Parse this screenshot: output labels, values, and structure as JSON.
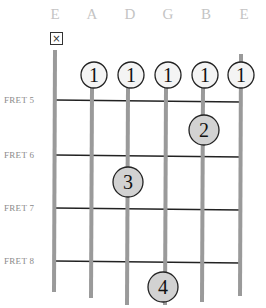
{
  "diagram": {
    "strings": [
      {
        "name": "E",
        "x": 55,
        "top": 50,
        "bottom": 292
      },
      {
        "name": "A",
        "x": 92,
        "top": 88,
        "bottom": 298
      },
      {
        "name": "D",
        "x": 128,
        "top": 88,
        "bottom": 305
      },
      {
        "name": "G",
        "x": 166,
        "top": 88,
        "bottom": 305
      },
      {
        "name": "B",
        "x": 203,
        "top": 88,
        "bottom": 302
      },
      {
        "name": "E",
        "x": 241,
        "top": 54,
        "bottom": 296
      }
    ],
    "frets": [
      {
        "label": "FRET 5",
        "y": 100
      },
      {
        "label": "FRET 6",
        "y": 155
      },
      {
        "label": "FRET 7",
        "y": 208
      },
      {
        "label": "FRET 8",
        "y": 261
      }
    ],
    "muted_string": {
      "symbol": "×",
      "string": "E (low)"
    },
    "fingers": [
      {
        "finger": "1",
        "string": "A",
        "fret": 5,
        "cx": 94,
        "cy": 75,
        "fill": "#f4f4f4"
      },
      {
        "finger": "1",
        "string": "D",
        "fret": 5,
        "cx": 131,
        "cy": 75,
        "fill": "#f4f4f4"
      },
      {
        "finger": "1",
        "string": "G",
        "fret": 5,
        "cx": 168,
        "cy": 75,
        "fill": "#f4f4f4"
      },
      {
        "finger": "1",
        "string": "B",
        "fret": 5,
        "cx": 205,
        "cy": 75,
        "fill": "#f4f4f4"
      },
      {
        "finger": "1",
        "string": "E (high)",
        "fret": 5,
        "cx": 241,
        "cy": 75,
        "fill": "#f4f4f4"
      },
      {
        "finger": "2",
        "string": "B",
        "fret": 6,
        "cx": 204,
        "cy": 130,
        "fill": "#d2d2d2"
      },
      {
        "finger": "3",
        "string": "D",
        "fret": 7,
        "cx": 128,
        "cy": 182,
        "fill": "#d2d2d2"
      },
      {
        "finger": "4",
        "string": "G",
        "fret": 9,
        "cx": 163,
        "cy": 287,
        "fill": "#d2d2d2"
      }
    ],
    "colors": {
      "string": "#9a9a9a",
      "fret": "#222222",
      "circle_stroke": "#222222",
      "label": "#c4c4c4"
    }
  }
}
